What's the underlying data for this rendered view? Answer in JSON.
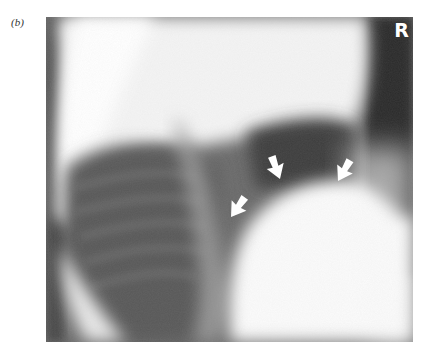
{
  "figure": {
    "panel_label": "(b)",
    "image_type": "lateral chest radiograph",
    "side_marker": "R",
    "annotations": [
      {
        "type": "arrow",
        "color": "#ffffff",
        "direction": "down-right"
      },
      {
        "type": "arrow",
        "color": "#ffffff",
        "direction": "down"
      },
      {
        "type": "arrow",
        "color": "#ffffff",
        "direction": "down-left"
      }
    ]
  }
}
